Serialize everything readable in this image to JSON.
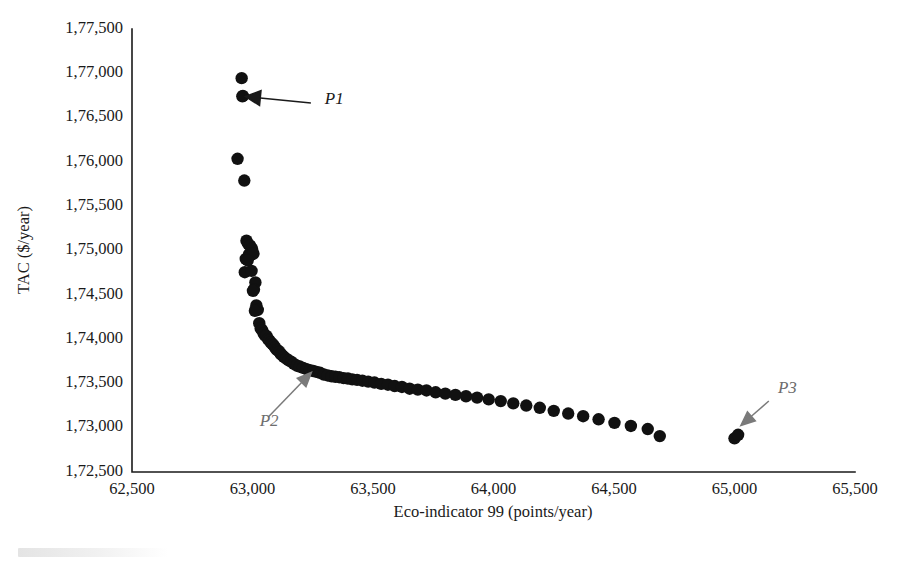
{
  "chart_data": {
    "type": "scatter",
    "title": "",
    "xlabel": "Eco-indicator 99 (points/year)",
    "ylabel": "TAC ($/year)",
    "xlim": [
      62500,
      65500
    ],
    "ylim": [
      172500,
      177500
    ],
    "xticks": [
      "62,500",
      "63,000",
      "63,500",
      "64,000",
      "64,500",
      "65,000",
      "65,500"
    ],
    "xtick_values": [
      62500,
      63000,
      63500,
      64000,
      64500,
      65000,
      65500
    ],
    "yticks": [
      "1,72,500",
      "1,73,000",
      "1,73,500",
      "1,74,000",
      "1,74,500",
      "1,75,000",
      "1,75,500",
      "1,76,000",
      "1,76,500",
      "1,77,000",
      "1,77,500"
    ],
    "ytick_values": [
      172500,
      173000,
      173500,
      174000,
      174500,
      175000,
      175500,
      176000,
      176500,
      177000,
      177500
    ],
    "grid": false,
    "legend": null,
    "marker_color": "#111111",
    "marker_size": 6.2,
    "series": [
      {
        "name": "Pareto front",
        "points": [
          [
            62955,
            176945
          ],
          [
            62958,
            176740
          ],
          [
            62960,
            176745
          ],
          [
            62938,
            176035
          ],
          [
            62966,
            175790
          ],
          [
            62975,
            175110
          ],
          [
            62982,
            175075
          ],
          [
            62990,
            175055
          ],
          [
            62998,
            175020
          ],
          [
            62986,
            174960
          ],
          [
            62994,
            174950
          ],
          [
            63004,
            174965
          ],
          [
            62972,
            174905
          ],
          [
            62980,
            174890
          ],
          [
            62968,
            174755
          ],
          [
            62996,
            174770
          ],
          [
            63012,
            174640
          ],
          [
            63006,
            174560
          ],
          [
            63002,
            174545
          ],
          [
            63016,
            174380
          ],
          [
            63022,
            174330
          ],
          [
            63010,
            174320
          ],
          [
            63028,
            174180
          ],
          [
            63034,
            174120
          ],
          [
            63040,
            174100
          ],
          [
            63046,
            174065
          ],
          [
            63052,
            174040
          ],
          [
            63058,
            174035
          ],
          [
            63064,
            174000
          ],
          [
            63070,
            173985
          ],
          [
            63076,
            173960
          ],
          [
            63082,
            173945
          ],
          [
            63088,
            173930
          ],
          [
            63094,
            173905
          ],
          [
            63100,
            173880
          ],
          [
            63106,
            173870
          ],
          [
            63112,
            173855
          ],
          [
            63118,
            173830
          ],
          [
            63124,
            173815
          ],
          [
            63130,
            173800
          ],
          [
            63140,
            173780
          ],
          [
            63150,
            173760
          ],
          [
            63160,
            173745
          ],
          [
            63172,
            173720
          ],
          [
            63184,
            173700
          ],
          [
            63196,
            173690
          ],
          [
            63210,
            173675
          ],
          [
            63224,
            173660
          ],
          [
            63238,
            173650
          ],
          [
            63252,
            173640
          ],
          [
            63266,
            173630
          ],
          [
            63280,
            173620
          ],
          [
            63296,
            173600
          ],
          [
            63312,
            173590
          ],
          [
            63328,
            173580
          ],
          [
            63344,
            173575
          ],
          [
            63360,
            173570
          ],
          [
            63378,
            173560
          ],
          [
            63396,
            173555
          ],
          [
            63414,
            173545
          ],
          [
            63434,
            173540
          ],
          [
            63456,
            173530
          ],
          [
            63480,
            173520
          ],
          [
            63506,
            173510
          ],
          [
            63534,
            173495
          ],
          [
            63562,
            173485
          ],
          [
            63590,
            173470
          ],
          [
            63620,
            173460
          ],
          [
            63652,
            173440
          ],
          [
            63686,
            173430
          ],
          [
            63722,
            173420
          ],
          [
            63760,
            173400
          ],
          [
            63800,
            173385
          ],
          [
            63842,
            173370
          ],
          [
            63886,
            173355
          ],
          [
            63932,
            173340
          ],
          [
            63980,
            173320
          ],
          [
            64030,
            173300
          ],
          [
            64082,
            173275
          ],
          [
            64136,
            173250
          ],
          [
            64192,
            173225
          ],
          [
            64250,
            173190
          ],
          [
            64310,
            173160
          ],
          [
            64372,
            173130
          ],
          [
            64436,
            173095
          ],
          [
            64502,
            173055
          ],
          [
            64570,
            173020
          ],
          [
            64640,
            172985
          ],
          [
            64690,
            172905
          ],
          [
            65000,
            172880
          ],
          [
            65015,
            172920
          ]
        ]
      }
    ],
    "annotations": [
      {
        "label": "P1",
        "arrow": "left",
        "color": "#1a1a1a",
        "target_x": 62962,
        "target_y": 176740,
        "label_x": 63300,
        "label_y": 176650
      },
      {
        "label": "P2",
        "arrow": "up-right",
        "color": "#7a7a7a",
        "target_x": 63250,
        "target_y": 173640,
        "label_x": 63030,
        "label_y": 173020
      },
      {
        "label": "P3",
        "arrow": "down-left",
        "color": "#7a7a7a",
        "target_x": 65020,
        "target_y": 173010,
        "label_x": 65180,
        "label_y": 173390
      }
    ]
  },
  "figure": {
    "plot_left_px": 132,
    "plot_right_px": 855,
    "plot_top_px": 29,
    "plot_bottom_px": 472
  }
}
